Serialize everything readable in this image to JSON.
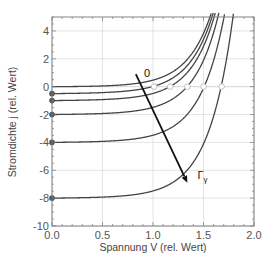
{
  "chart_data": {
    "type": "line",
    "title": "",
    "xlabel": "Spannung V (rel. Wert)",
    "ylabel": "Stromdichte j (rel. Wert)",
    "xlim": [
      0.0,
      2.0
    ],
    "ylim": [
      -10,
      5
    ],
    "xticks": [
      "0.0",
      "0.5",
      "1.0",
      "1.5",
      "2.0"
    ],
    "xtick_values": [
      0.0,
      0.5,
      1.0,
      1.5,
      2.0
    ],
    "yticks": [
      "4",
      "2",
      "0",
      "-2",
      "-4",
      "-6",
      "-8",
      "-10"
    ],
    "ytick_values": [
      4,
      2,
      0,
      -2,
      -4,
      -6,
      -8,
      -10
    ],
    "grid": true,
    "legend": null,
    "model": {
      "formula": "j = -jsc + j0*(exp(V/n)-1) + g*V",
      "j0": 0.0074,
      "n": 0.24,
      "g": 0.25
    },
    "series": [
      {
        "name": "Γγ = 0",
        "jsc": 0.0,
        "j_at_V0": 0.0,
        "open_circuit_voltage": null,
        "start_marker": false
      },
      {
        "name": "Γγ = 0.5",
        "jsc": 0.5,
        "j_at_V0": -0.5,
        "open_circuit_voltage": 1.01,
        "start_marker": true
      },
      {
        "name": "Γγ = 1",
        "jsc": 1.0,
        "j_at_V0": -1.0,
        "open_circuit_voltage": 1.17,
        "start_marker": true
      },
      {
        "name": "Γγ = 2",
        "jsc": 2.0,
        "j_at_V0": -2.0,
        "open_circuit_voltage": 1.34,
        "start_marker": true
      },
      {
        "name": "Γγ = 4",
        "jsc": 4.0,
        "j_at_V0": -4.0,
        "open_circuit_voltage": 1.5,
        "start_marker": true
      },
      {
        "name": "Γγ = 8",
        "jsc": 8.0,
        "j_at_V0": -8.0,
        "open_circuit_voltage": 1.68,
        "start_marker": true
      }
    ],
    "open_circuit_points": [
      {
        "V": 1.01,
        "j": 0
      },
      {
        "V": 1.17,
        "j": 0
      },
      {
        "V": 1.34,
        "j": 0
      },
      {
        "V": 1.5,
        "j": 0
      },
      {
        "V": 1.68,
        "j": 0
      }
    ],
    "annotations": [
      {
        "text": "0",
        "x": 0.91,
        "y": 0.7
      },
      {
        "text": "Γγ",
        "x": 1.44,
        "y": -6.6,
        "arrow_from": [
          0.83,
          0.9
        ],
        "arrow_to": [
          1.34,
          -6.9
        ]
      }
    ]
  },
  "colors": {
    "curve": "#444444",
    "marker_fill": "#555555",
    "open_marker_fill": "#ffffff",
    "open_marker_stroke": "#bbbbbb",
    "grid": "#dddddd",
    "frame": "#777777",
    "arrow": "#111111"
  }
}
